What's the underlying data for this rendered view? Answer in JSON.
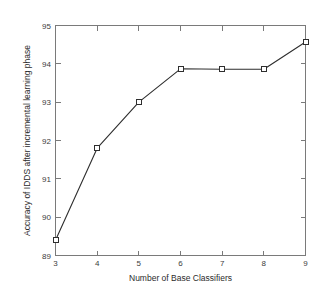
{
  "chart_data": {
    "type": "line",
    "title": "",
    "subtitle": "",
    "xlabel": "Number of Base Classifiers",
    "ylabel": "Accuracy of IDDS after incremental learning phase",
    "x": [
      3,
      4,
      5,
      6,
      7,
      8,
      9
    ],
    "values": [
      89.4,
      91.8,
      93.0,
      93.87,
      93.86,
      93.86,
      94.57
    ],
    "series": [
      {
        "name": "Accuracy of IDDS after incremental learning phase",
        "values": [
          89.4,
          91.8,
          93.0,
          93.87,
          93.86,
          93.86,
          94.57
        ]
      }
    ],
    "xlim": [
      3,
      9
    ],
    "ylim": [
      89,
      95
    ],
    "xticks": [
      3,
      4,
      5,
      6,
      7,
      8,
      9
    ],
    "yticks": [
      89,
      90,
      91,
      92,
      93,
      94,
      95
    ],
    "xtick_labels": [
      "3",
      "4",
      "5",
      "6",
      "7",
      "8",
      "9"
    ],
    "ytick_labels": [
      "89",
      "90",
      "91",
      "92",
      "93",
      "94",
      "95"
    ],
    "grid": false,
    "legend": false,
    "legend_position": "none",
    "marker": "square",
    "line_color": "#2e2e2e",
    "marker_face_color": "#ffffff",
    "marker_edge_color": "#2e2e2e",
    "axis_color": "#7a7a7a",
    "background_color": "#ffffff"
  }
}
